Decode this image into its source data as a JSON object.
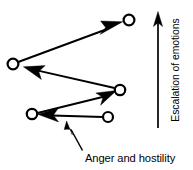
{
  "diagram": {
    "title": "Escalation of emotions",
    "background_color": "#ffffff",
    "stroke_color": "#000000",
    "axis": {
      "label": "Escalation of emotions",
      "direction": "up",
      "arrow_icon": "up-arrow-icon"
    },
    "caption": {
      "label": "Anger and hostility",
      "pointer_icon": "pointer-arrow-icon"
    },
    "nodes": [
      {
        "id": "node-1",
        "name": "lower-right-node",
        "cx": 108,
        "cy": 117,
        "r": 5.0
      },
      {
        "id": "node-2",
        "name": "lower-left-node",
        "cx": 32,
        "cy": 114,
        "r": 5.2
      },
      {
        "id": "node-3",
        "name": "middle-right-node",
        "cx": 120,
        "cy": 90,
        "r": 5.2
      },
      {
        "id": "node-4",
        "name": "left-node",
        "cx": 13,
        "cy": 64,
        "r": 5.4
      },
      {
        "id": "node-5",
        "name": "top-right-node",
        "cx": 129,
        "cy": 20,
        "r": 5.4
      }
    ],
    "arrows": [
      {
        "id": "arrow-1",
        "name": "arrow-lower-right-to-lower-left",
        "from": "node-1",
        "to": "node-2",
        "direction": "left"
      },
      {
        "id": "arrow-2",
        "name": "arrow-lower-left-to-middle-right",
        "from": "node-2",
        "to": "node-3",
        "direction": "right"
      },
      {
        "id": "arrow-3",
        "name": "arrow-middle-right-to-left",
        "from": "node-3",
        "to": "node-4",
        "direction": "left"
      },
      {
        "id": "arrow-4",
        "name": "arrow-left-to-top-right",
        "from": "node-4",
        "to": "node-5",
        "direction": "right"
      }
    ]
  }
}
